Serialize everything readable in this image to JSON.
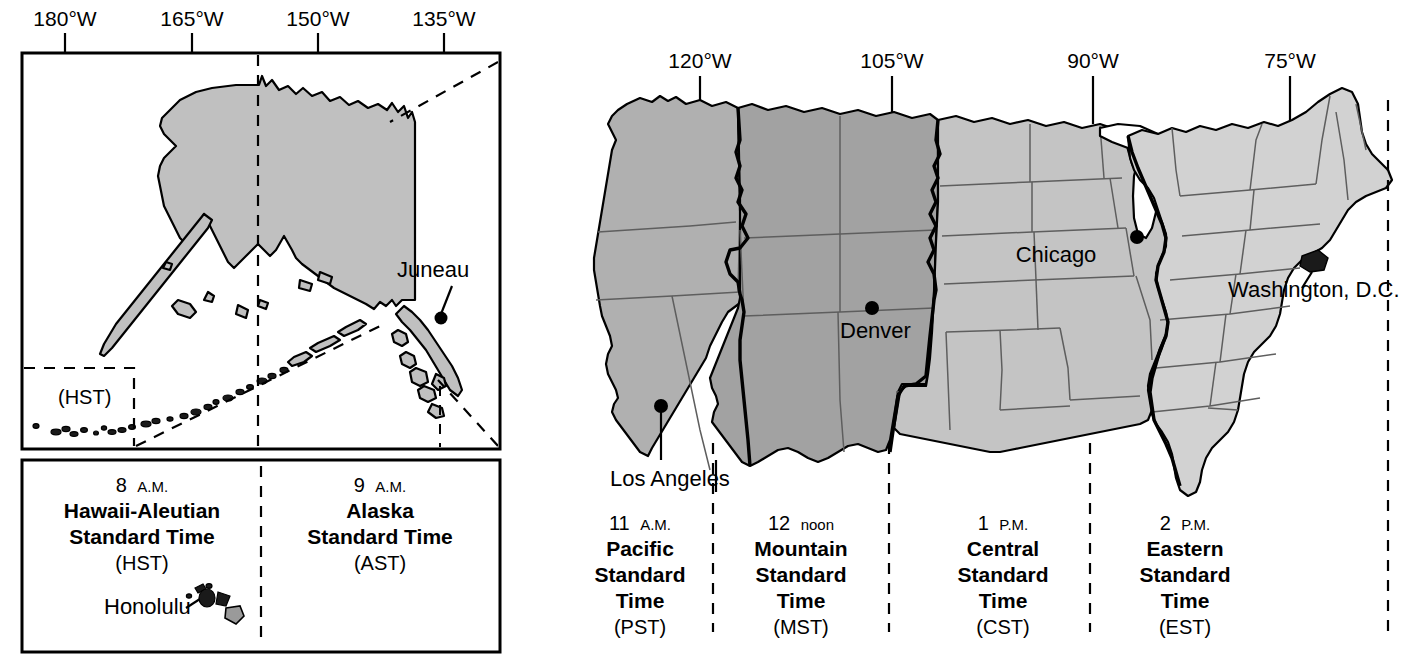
{
  "figure": {
    "type": "map"
  },
  "alaska_inset": {
    "longitude_labels": [
      "180°W",
      "165°W",
      "150°W",
      "135°W"
    ],
    "city": "Juneau",
    "aleutian_zone_label": "(HST)"
  },
  "main_map": {
    "longitude_labels": [
      "120°W",
      "105°W",
      "90°W",
      "75°W"
    ],
    "cities": [
      {
        "name": "Los Angeles"
      },
      {
        "name": "Denver"
      },
      {
        "name": "Chicago"
      },
      {
        "name": "Washington, D.C."
      }
    ]
  },
  "inset_legend": {
    "zones": [
      {
        "time": "8",
        "ampm": "A.M.",
        "name_line1": "Hawaii-Aleutian",
        "name_line2": "Standard Time",
        "abbr": "(HST)",
        "city": "Honolulu"
      },
      {
        "time": "9",
        "ampm": "A.M.",
        "name_line1": "Alaska",
        "name_line2": "Standard Time",
        "abbr": "(AST)"
      }
    ]
  },
  "main_legend": {
    "zones": [
      {
        "time": "11",
        "ampm": "A.M.",
        "name_line1": "Pacific",
        "name_line2": "Standard",
        "name_line3": "Time",
        "abbr": "(PST)"
      },
      {
        "time": "12",
        "ampm": "noon",
        "name_line1": "Mountain",
        "name_line2": "Standard",
        "name_line3": "Time",
        "abbr": "(MST)"
      },
      {
        "time": "1",
        "ampm": "P.M.",
        "name_line1": "Central",
        "name_line2": "Standard",
        "name_line3": "Time",
        "abbr": "(CST)"
      },
      {
        "time": "2",
        "ampm": "P.M.",
        "name_line1": "Eastern",
        "name_line2": "Standard",
        "name_line3": "Time",
        "abbr": "(EST)"
      }
    ]
  },
  "colors": {
    "pacific_fill": "#b0b0b0",
    "mountain_fill": "#a2a2a2",
    "central_fill": "#c4c4c4",
    "eastern_fill": "#d2d2d2",
    "alaska_fill": "#c0c0c0",
    "hawaii_fill": "#9a9a9a",
    "outline": "#000000",
    "state_line": "#5e5e5e",
    "background": "#ffffff"
  }
}
